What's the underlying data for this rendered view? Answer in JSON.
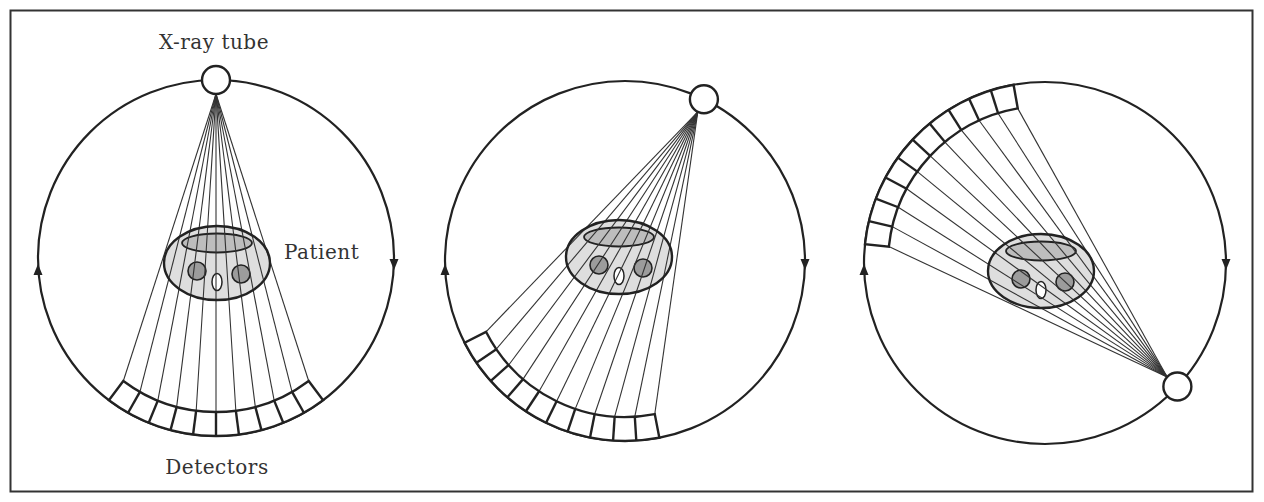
{
  "diagram": {
    "labels": {
      "tube": "X-ray tube",
      "patient": "Patient",
      "detectors": "Detectors"
    },
    "colors": {
      "stroke": "#222222",
      "ray": "#333333",
      "patient_fill": "#dedede",
      "organ_fill": "#9c9c9c",
      "top_ellipse_fill": "#bdbdbd",
      "background": "#ffffff",
      "frame": "#333333"
    },
    "detector_cells": 10,
    "rays": 11,
    "rotation_direction": "clockwise",
    "panels": [
      {
        "name": "position-1",
        "cx": 216,
        "cy": 258,
        "r": 178,
        "tube_angle_deg": -90,
        "patient": {
          "cx": 217,
          "cy": 263
        },
        "arrows": {
          "left_y": 272,
          "right_y": 262
        }
      },
      {
        "name": "position-2",
        "cx": 625,
        "cy": 261,
        "r": 180,
        "tube_angle_deg": -64,
        "patient": {
          "cx": 619,
          "cy": 257
        },
        "arrows": {
          "left_y": 272,
          "right_y": 262
        }
      },
      {
        "name": "position-3",
        "cx": 1045,
        "cy": 263,
        "r": 181,
        "tube_angle_deg": 43,
        "patient": {
          "cx": 1041,
          "cy": 271
        },
        "arrows": {
          "left_y": 272,
          "right_y": 262
        }
      }
    ]
  }
}
